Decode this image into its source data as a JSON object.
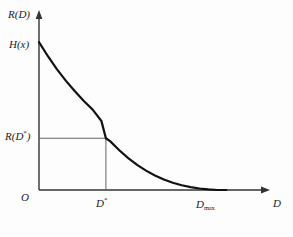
{
  "figure": {
    "name": "rate-distortion-function-plot",
    "background_color": "#fdfdfd",
    "curve_color": "#111111",
    "axis_color": "#333333",
    "guide_line_color": "#555555"
  },
  "labels": {
    "y_axis": "R(D)",
    "x_axis": "D",
    "origin": "O",
    "curve_start": "H(x)",
    "rate_at_dstar_prefix": "R(D",
    "rate_at_dstar_star": "*",
    "rate_at_dstar_suffix": ")",
    "dstar_base": "D",
    "dstar_star": "*",
    "dmax_base": "D",
    "dmax_sub": "max"
  },
  "chart_data": {
    "type": "line",
    "title": "",
    "subtitle": "",
    "xlabel": "D",
    "ylabel": "R(D)",
    "grid": false,
    "legend": null,
    "xlim": [
      0,
      1.25
    ],
    "ylim": [
      0,
      1.15
    ],
    "axis_origin_label": "O",
    "annotations": [
      {
        "text": "H(x)",
        "x": 0,
        "y": 1.0,
        "role": "curve-intercept-on-y-axis"
      },
      {
        "text": "R(D*)",
        "x": 0,
        "y": 0.35,
        "role": "y-axis-tick-value"
      },
      {
        "text": "D*",
        "x": 0.375,
        "y": 0,
        "role": "x-axis-tick-value"
      },
      {
        "text": "Dmax",
        "x": 1.0,
        "y": 0,
        "role": "x-axis-tick-value"
      }
    ],
    "guide_lines": [
      {
        "from": [
          0,
          0.35
        ],
        "to": [
          0.375,
          0.35
        ],
        "style": "solid-thin"
      },
      {
        "from": [
          0.375,
          0.35
        ],
        "to": [
          0.375,
          0
        ],
        "style": "solid-thin"
      }
    ],
    "series": [
      {
        "name": "R(D)",
        "x": [
          0.0,
          0.05,
          0.1,
          0.15,
          0.2,
          0.25,
          0.3,
          0.35,
          0.375,
          0.4,
          0.45,
          0.5,
          0.55,
          0.6,
          0.65,
          0.7,
          0.75,
          0.8,
          0.85,
          0.9,
          0.95,
          1.0,
          1.05
        ],
        "values": [
          1.0,
          0.905,
          0.818,
          0.74,
          0.67,
          0.604,
          0.545,
          0.466,
          0.35,
          0.329,
          0.269,
          0.216,
          0.17,
          0.131,
          0.098,
          0.071,
          0.049,
          0.032,
          0.019,
          0.01,
          0.004,
          0.0,
          0.0
        ]
      }
    ]
  }
}
